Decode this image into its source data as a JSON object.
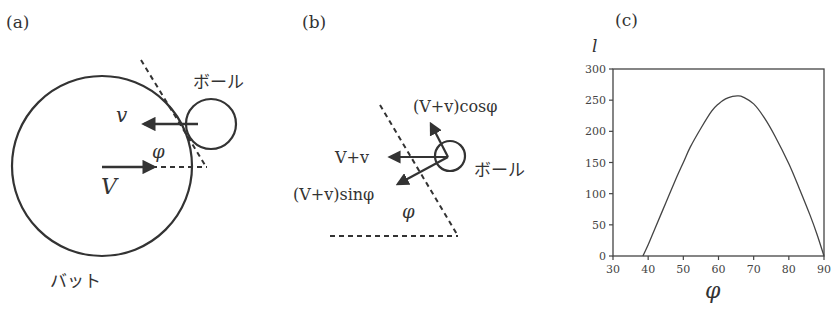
{
  "panels": {
    "a": {
      "label": "(a)",
      "bat_label": "バット",
      "ball_label": "ボール",
      "v_label": "v",
      "V_label": "V",
      "phi_label": "φ"
    },
    "b": {
      "label": "(b)",
      "cos_label": "(V+v)cosφ",
      "sum_label": "V+v",
      "sin_label": "(V+v)sinφ",
      "ball_label": "ボール",
      "phi_label": "φ"
    },
    "c": {
      "label": "(c)",
      "ylabel": "l",
      "xlabel": "φ"
    }
  },
  "chart_data": {
    "type": "line",
    "title": "",
    "xlabel": "φ",
    "ylabel": "l",
    "xlim": [
      30,
      90
    ],
    "ylim": [
      0,
      300
    ],
    "x_ticks": [
      "30",
      "40",
      "50",
      "60",
      "70",
      "80",
      "90"
    ],
    "y_ticks": [
      "0",
      "50",
      "100",
      "150",
      "200",
      "250",
      "300"
    ],
    "grid": false,
    "legend": null,
    "series": [
      {
        "name": "l(φ)",
        "x": [
          38.5,
          40,
          42,
          45,
          48,
          50,
          52,
          55,
          58,
          60,
          62,
          64,
          65.5,
          67,
          70,
          73,
          76,
          80,
          83,
          86,
          88,
          90
        ],
        "y": [
          0,
          18,
          45,
          85,
          125,
          150,
          175,
          205,
          232,
          244,
          252,
          256,
          257,
          255,
          244,
          222,
          193,
          148,
          108,
          66,
          35,
          0
        ]
      }
    ]
  }
}
